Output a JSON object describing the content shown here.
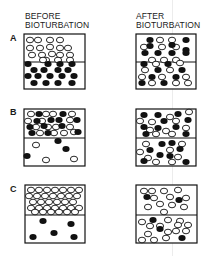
{
  "headers": {
    "before": [
      "BEFORE",
      "BIOTURBATION"
    ],
    "after": [
      "AFTER",
      "BIOTURBATION"
    ]
  },
  "rows": [
    {
      "label": "A",
      "before": {
        "box": [
          24,
          34,
          61,
          55
        ],
        "divider": 62,
        "open": [
          [
            30,
            40
          ],
          [
            38,
            40
          ],
          [
            50,
            40
          ],
          [
            60,
            40
          ],
          [
            30,
            48
          ],
          [
            40,
            48
          ],
          [
            50,
            47
          ],
          [
            60,
            48
          ],
          [
            68,
            48
          ],
          [
            32,
            55
          ],
          [
            42,
            55
          ],
          [
            52,
            54
          ],
          [
            60,
            55
          ],
          [
            70,
            55
          ],
          [
            46,
            60
          ],
          [
            58,
            60
          ],
          [
            43,
            60
          ],
          [
            70,
            60
          ]
        ],
        "filled": [
          [
            28,
            64
          ],
          [
            48,
            64
          ],
          [
            60,
            64
          ],
          [
            72,
            64
          ],
          [
            34,
            70
          ],
          [
            44,
            70
          ],
          [
            58,
            70
          ],
          [
            68,
            70
          ],
          [
            28,
            76
          ],
          [
            38,
            76
          ],
          [
            50,
            76
          ],
          [
            62,
            76
          ],
          [
            74,
            76
          ],
          [
            34,
            83
          ],
          [
            46,
            83
          ],
          [
            58,
            83
          ],
          [
            72,
            83
          ]
        ]
      },
      "after": {
        "box": [
          136,
          34,
          60,
          55
        ],
        "divider": 62,
        "filled": [
          [
            150,
            40
          ],
          [
            186,
            40
          ],
          [
            150,
            46
          ],
          [
            172,
            45
          ],
          [
            186,
            50
          ],
          [
            145,
            53
          ],
          [
            158,
            53
          ],
          [
            172,
            53
          ],
          [
            186,
            53
          ],
          [
            144,
            64
          ],
          [
            168,
            64
          ],
          [
            158,
            70
          ],
          [
            182,
            70
          ],
          [
            152,
            77
          ],
          [
            176,
            77
          ],
          [
            142,
            83
          ],
          [
            164,
            83
          ]
        ],
        "open": [
          [
            160,
            40
          ],
          [
            172,
            40
          ],
          [
            144,
            47
          ],
          [
            162,
            47
          ],
          [
            176,
            47
          ],
          [
            152,
            60
          ],
          [
            164,
            60
          ],
          [
            176,
            60
          ],
          [
            156,
            64
          ],
          [
            180,
            63
          ],
          [
            145,
            70
          ],
          [
            170,
            70
          ],
          [
            142,
            77
          ],
          [
            162,
            77
          ],
          [
            186,
            77
          ],
          [
            152,
            83
          ],
          [
            176,
            83
          ],
          [
            188,
            83
          ]
        ]
      }
    },
    {
      "label": "B",
      "before": {
        "box": [
          24,
          109,
          61,
          57
        ],
        "divider": 138,
        "open": [
          [
            31,
            114
          ],
          [
            46,
            114
          ],
          [
            53,
            114
          ],
          [
            72,
            114
          ],
          [
            28,
            121
          ],
          [
            42,
            121
          ],
          [
            70,
            120
          ],
          [
            36,
            127
          ],
          [
            48,
            127
          ],
          [
            56,
            127
          ],
          [
            70,
            127
          ],
          [
            40,
            133
          ],
          [
            54,
            133
          ],
          [
            64,
            133
          ],
          [
            74,
            132
          ],
          [
            36,
            145
          ],
          [
            46,
            160
          ],
          [
            74,
            159
          ]
        ],
        "filled": [
          [
            39,
            114
          ],
          [
            63,
            114
          ],
          [
            37,
            121
          ],
          [
            51,
            120
          ],
          [
            59,
            120
          ],
          [
            77,
            120
          ],
          [
            30,
            127
          ],
          [
            44,
            126
          ],
          [
            62,
            126
          ],
          [
            32,
            133
          ],
          [
            48,
            133
          ],
          [
            78,
            132
          ],
          [
            58,
            141
          ],
          [
            66,
            149
          ],
          [
            27,
            156
          ]
        ]
      },
      "after": {
        "box": [
          136,
          109,
          60,
          57
        ],
        "divider": 138,
        "filled": [
          [
            144,
            115
          ],
          [
            158,
            115
          ],
          [
            178,
            114
          ],
          [
            144,
            127
          ],
          [
            164,
            121
          ],
          [
            188,
            120
          ],
          [
            158,
            128
          ],
          [
            176,
            127
          ],
          [
            146,
            134
          ],
          [
            186,
            134
          ],
          [
            162,
            144
          ],
          [
            172,
            143
          ],
          [
            150,
            150
          ],
          [
            180,
            149
          ],
          [
            160,
            155
          ],
          [
            170,
            156
          ],
          [
            144,
            161
          ],
          [
            186,
            162
          ]
        ],
        "open": [
          [
            170,
            117
          ],
          [
            189,
            112
          ],
          [
            140,
            121
          ],
          [
            152,
            122
          ],
          [
            176,
            121
          ],
          [
            150,
            130
          ],
          [
            166,
            131
          ],
          [
            186,
            128
          ],
          [
            156,
            134
          ],
          [
            172,
            134
          ],
          [
            146,
            144
          ],
          [
            182,
            144
          ],
          [
            140,
            152
          ],
          [
            170,
            150
          ],
          [
            148,
            158
          ],
          [
            156,
            162
          ],
          [
            178,
            157
          ],
          [
            172,
            162
          ]
        ]
      }
    },
    {
      "label": "C",
      "before": {
        "box": [
          25,
          185,
          60,
          58
        ],
        "divider": 215,
        "open": [
          [
            31,
            190
          ],
          [
            39,
            190
          ],
          [
            47,
            190
          ],
          [
            55,
            190
          ],
          [
            63,
            190
          ],
          [
            71,
            190
          ],
          [
            79,
            190
          ],
          [
            29,
            196
          ],
          [
            37,
            196
          ],
          [
            45,
            196
          ],
          [
            53,
            196
          ],
          [
            61,
            196
          ],
          [
            69,
            196
          ],
          [
            77,
            196
          ],
          [
            33,
            202
          ],
          [
            41,
            202
          ],
          [
            49,
            202
          ],
          [
            57,
            202
          ],
          [
            65,
            202
          ],
          [
            73,
            202
          ],
          [
            31,
            208
          ],
          [
            39,
            208
          ],
          [
            47,
            208
          ],
          [
            55,
            208
          ],
          [
            63,
            208
          ],
          [
            71,
            208
          ],
          [
            79,
            208
          ],
          [
            35,
            212
          ],
          [
            43,
            212
          ],
          [
            51,
            212
          ],
          [
            59,
            212
          ],
          [
            67,
            212
          ],
          [
            75,
            212
          ]
        ],
        "filled": [
          [
            43,
            221
          ],
          [
            71,
            224
          ],
          [
            54,
            233
          ],
          [
            33,
            237
          ],
          [
            74,
            237
          ]
        ]
      },
      "after": {
        "box": [
          136,
          185,
          61,
          58
        ],
        "divider": 215,
        "open": [
          [
            144,
            191
          ],
          [
            152,
            191
          ],
          [
            164,
            191
          ],
          [
            178,
            190
          ],
          [
            154,
            198
          ],
          [
            170,
            197
          ],
          [
            186,
            198
          ],
          [
            148,
            207
          ],
          [
            160,
            204
          ],
          [
            172,
            205
          ],
          [
            184,
            207
          ],
          [
            164,
            212
          ],
          [
            142,
            222
          ],
          [
            168,
            220
          ],
          [
            180,
            221
          ],
          [
            150,
            226
          ],
          [
            160,
            226
          ],
          [
            178,
            225
          ],
          [
            188,
            225
          ],
          [
            148,
            234
          ],
          [
            168,
            232
          ],
          [
            176,
            231
          ],
          [
            186,
            231
          ],
          [
            142,
            240
          ],
          [
            154,
            240
          ],
          [
            166,
            238
          ]
        ],
        "filled": [
          [
            147,
            197
          ],
          [
            179,
            200
          ],
          [
            153,
            220
          ],
          [
            160,
            229
          ],
          [
            182,
            238
          ]
        ]
      }
    }
  ],
  "particle": {
    "rx": 3.6,
    "ry": 2.8
  },
  "colors": {
    "ink": "#111111",
    "paper": "#ffffff"
  }
}
